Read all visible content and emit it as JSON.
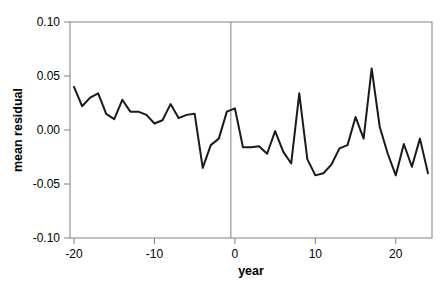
{
  "chart_data": {
    "type": "line",
    "title": "",
    "subtitle": "",
    "xlabel": "year",
    "ylabel": "mean residual",
    "xlim": [
      -20.5,
      24.5
    ],
    "ylim": [
      -0.1,
      0.1
    ],
    "xticks": [
      -20,
      -10,
      0,
      10,
      20
    ],
    "xtick_labels": [
      "-20",
      "-10",
      "0",
      "10",
      "20"
    ],
    "yticks": [
      -0.1,
      -0.05,
      0.0,
      0.05,
      0.1
    ],
    "ytick_labels": [
      "-0.10",
      "-0.05",
      "0.00",
      "0.05",
      "0.10"
    ],
    "grid": false,
    "legend": null,
    "legend_position": "none",
    "line_color": "#1a1a1a",
    "line_width": 2.0,
    "axis_color": "#808080",
    "reference_line": {
      "orientation": "vertical",
      "x": -0.5,
      "color": "#808080",
      "width": 1
    },
    "series": [
      {
        "name": "mean residual",
        "x": [
          -20,
          -19,
          -18,
          -17,
          -16,
          -15,
          -14,
          -13,
          -12,
          -11,
          -10,
          -9,
          -8,
          -7,
          -6,
          -5,
          -4,
          -3,
          -2,
          -1,
          0,
          1,
          2,
          3,
          4,
          5,
          6,
          7,
          8,
          9,
          10,
          11,
          12,
          13,
          14,
          15,
          16,
          17,
          18,
          19,
          20,
          21,
          22,
          23,
          24
        ],
        "values": [
          0.04,
          0.022,
          0.03,
          0.034,
          0.015,
          0.01,
          0.028,
          0.017,
          0.017,
          0.014,
          0.006,
          0.009,
          0.024,
          0.011,
          0.014,
          0.015,
          -0.035,
          -0.014,
          -0.008,
          0.017,
          0.02,
          -0.016,
          -0.016,
          -0.015,
          -0.022,
          -0.001,
          -0.02,
          -0.031,
          0.034,
          -0.027,
          -0.042,
          -0.04,
          -0.032,
          -0.017,
          -0.014,
          0.012,
          -0.008,
          0.057,
          0.003,
          -0.022,
          -0.042,
          -0.013,
          -0.034,
          -0.008,
          -0.04
        ]
      }
    ]
  }
}
